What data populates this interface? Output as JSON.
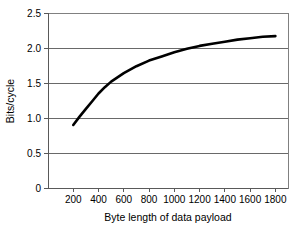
{
  "chart_data": {
    "type": "line",
    "title": "",
    "xlabel": "Byte length of data payload",
    "ylabel": "Bits/cycle",
    "xlim": [
      0,
      1900
    ],
    "ylim": [
      0,
      2.5
    ],
    "grid": "horizontal",
    "legend": "none",
    "x_ticks": [
      "200",
      "400",
      "600",
      "800",
      "1000",
      "1200",
      "1400",
      "1600",
      "1800"
    ],
    "x_tick_values": [
      200,
      400,
      600,
      800,
      1000,
      1200,
      1400,
      1600,
      1800
    ],
    "y_ticks": [
      "0",
      "0.5",
      "1.0",
      "1.5",
      "2.0",
      "2.5"
    ],
    "y_tick_values": [
      0,
      0.5,
      1.0,
      1.5,
      2.0,
      2.5
    ],
    "series": [
      {
        "name": "Bits/cycle",
        "color": "#000000",
        "x": [
          200,
          250,
          300,
          350,
          400,
          450,
          500,
          600,
          700,
          800,
          900,
          1000,
          1100,
          1200,
          1300,
          1400,
          1500,
          1600,
          1700,
          1800
        ],
        "values": [
          0.9,
          1.02,
          1.13,
          1.24,
          1.35,
          1.44,
          1.52,
          1.64,
          1.74,
          1.82,
          1.88,
          1.94,
          1.99,
          2.03,
          2.06,
          2.09,
          2.12,
          2.14,
          2.16,
          2.17
        ]
      }
    ]
  },
  "axes": {
    "x_axis_title": "Byte length of data payload",
    "y_axis_title": "Bits/cycle"
  }
}
